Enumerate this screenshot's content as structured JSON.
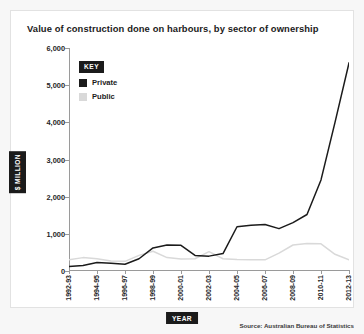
{
  "card": {
    "title": "Value of construction done on harbours, by sector of ownership"
  },
  "legend": {
    "key_label": "KEY",
    "items": [
      {
        "label": "Private",
        "color": "#1b1b1b"
      },
      {
        "label": "Public",
        "color": "#d9d9d9"
      }
    ]
  },
  "axis": {
    "y_label": "$ MILLION",
    "x_label": "YEAR"
  },
  "source": "Source: Australian Bureau of Statistics",
  "chart_data": {
    "type": "line",
    "title": "Value of construction done on harbours, by sector of ownership",
    "xlabel": "YEAR",
    "ylabel": "$ MILLION",
    "ylim": [
      0,
      6000
    ],
    "yticks": [
      "0",
      "1,000",
      "2,000",
      "3,000",
      "4,000",
      "5,000",
      "6,000"
    ],
    "ytick_values": [
      0,
      1000,
      2000,
      3000,
      4000,
      5000,
      6000
    ],
    "grid": false,
    "legend_position": "top-left",
    "categories": [
      "1992-93",
      "1993-94",
      "1994-95",
      "1995-96",
      "1996-97",
      "1997-98",
      "1998-99",
      "1999-00",
      "2000-01",
      "2001-02",
      "2002-03",
      "2003-04",
      "2004-05",
      "2005-06",
      "2006-07",
      "2007-08",
      "2008-09",
      "2009-10",
      "2010-11",
      "2011-12",
      "2012-13"
    ],
    "xtick_labels": [
      "1992-93",
      "1994-95",
      "1996-97",
      "1998-99",
      "2000-01",
      "2002-03",
      "2004-05",
      "2006-07",
      "2008-09",
      "2010-11",
      "2012-13"
    ],
    "xtick_indices": [
      0,
      2,
      4,
      6,
      8,
      10,
      12,
      14,
      16,
      18,
      20
    ],
    "series": [
      {
        "name": "Private",
        "color": "#1b1b1b",
        "values": [
          120,
          150,
          230,
          210,
          180,
          330,
          620,
          700,
          690,
          420,
          400,
          470,
          1190,
          1230,
          1250,
          1140,
          1300,
          1520,
          2450,
          4000,
          5600
        ]
      },
      {
        "name": "Public",
        "color": "#d9d9d9",
        "values": [
          300,
          360,
          330,
          270,
          260,
          420,
          530,
          360,
          320,
          330,
          520,
          330,
          310,
          300,
          300,
          480,
          700,
          740,
          730,
          450,
          300
        ]
      }
    ]
  }
}
